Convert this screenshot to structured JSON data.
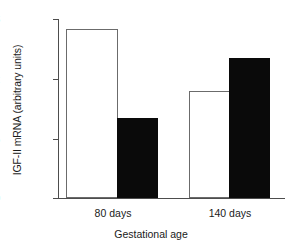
{
  "chart_data": {
    "type": "bar",
    "title": "",
    "xlabel": "Gestational age",
    "ylabel": "IGF-II mRNA (arbitrary units)",
    "categories": [
      "80 days",
      "140 days"
    ],
    "series": [
      {
        "name": "white-bar",
        "values": [
          17.0,
          10.8
        ],
        "color": "#ffffff"
      },
      {
        "name": "black-bar",
        "values": [
          8.0,
          14.1
        ],
        "color": "#0a0a0a"
      }
    ],
    "ylim": [
      0,
      18
    ],
    "yticks": [
      0,
      6,
      12,
      18
    ],
    "ytick_labels": [
      "0",
      "6",
      "12",
      "18"
    ],
    "grid": false,
    "legend": "none"
  },
  "axis": {
    "y_title": "IGF-II mRNA (arbitrary units)",
    "x_title": "Gestational age",
    "y_tick_0": "0",
    "y_tick_1": "6",
    "y_tick_2": "12",
    "y_tick_3": "18",
    "x_tick_0": "80 days",
    "x_tick_1": "140 days"
  }
}
